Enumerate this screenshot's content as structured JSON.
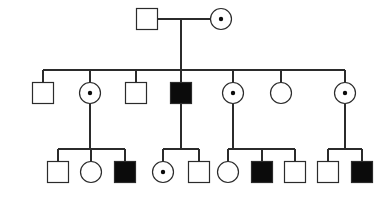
{
  "figure": {
    "kind": "pedigree-chart",
    "title": "Pedigree chart",
    "background_color": "#ffffff",
    "line_color": "#2b2b2b",
    "affected_fill": "#0b0b0b",
    "unaffected_fill": "#ffffff",
    "carrier_dot_color": "#0b0b0b"
  },
  "legend_semantics": {
    "square": "male",
    "circle": "female",
    "filled": "affected",
    "open": "unaffected",
    "dot_in_center": "carrier"
  },
  "chart_data": {
    "type": "diagram",
    "title": "Pedigree chart",
    "generations": [
      {
        "id": "I",
        "label": "I",
        "y": 19,
        "individuals": [
          {
            "id": "I-1",
            "sex": "male",
            "shape": "square",
            "status": "unaffected",
            "carrier": false,
            "cx": 147,
            "cy": 19
          },
          {
            "id": "I-2",
            "sex": "female",
            "shape": "circle",
            "status": "unaffected",
            "carrier": true,
            "cx": 221,
            "cy": 19
          }
        ]
      },
      {
        "id": "II",
        "label": "II",
        "y": 93,
        "individuals": [
          {
            "id": "II-1",
            "sex": "male",
            "shape": "square",
            "status": "unaffected",
            "carrier": false,
            "cx": 43,
            "cy": 93
          },
          {
            "id": "II-2",
            "sex": "female",
            "shape": "circle",
            "status": "unaffected",
            "carrier": true,
            "cx": 90,
            "cy": 93
          },
          {
            "id": "II-3",
            "sex": "male",
            "shape": "square",
            "status": "unaffected",
            "carrier": false,
            "cx": 136,
            "cy": 93
          },
          {
            "id": "II-4",
            "sex": "male",
            "shape": "square",
            "status": "affected",
            "carrier": false,
            "cx": 181,
            "cy": 93
          },
          {
            "id": "II-5",
            "sex": "female",
            "shape": "circle",
            "status": "unaffected",
            "carrier": true,
            "cx": 233,
            "cy": 93
          },
          {
            "id": "II-6",
            "sex": "female",
            "shape": "circle",
            "status": "unaffected",
            "carrier": false,
            "cx": 281,
            "cy": 93
          },
          {
            "id": "II-7",
            "sex": "female",
            "shape": "circle",
            "status": "unaffected",
            "carrier": true,
            "cx": 345,
            "cy": 93
          }
        ]
      },
      {
        "id": "III",
        "label": "III",
        "y": 172,
        "individuals": [
          {
            "id": "III-1",
            "sex": "male",
            "shape": "square",
            "status": "unaffected",
            "carrier": false,
            "cx": 58,
            "cy": 172
          },
          {
            "id": "III-2",
            "sex": "female",
            "shape": "circle",
            "status": "unaffected",
            "carrier": false,
            "cx": 91,
            "cy": 172
          },
          {
            "id": "III-3",
            "sex": "male",
            "shape": "square",
            "status": "affected",
            "carrier": false,
            "cx": 125,
            "cy": 172
          },
          {
            "id": "III-4",
            "sex": "female",
            "shape": "circle",
            "status": "unaffected",
            "carrier": true,
            "cx": 163,
            "cy": 172
          },
          {
            "id": "III-5",
            "sex": "male",
            "shape": "square",
            "status": "unaffected",
            "carrier": false,
            "cx": 199,
            "cy": 172
          },
          {
            "id": "III-6",
            "sex": "female",
            "shape": "circle",
            "status": "unaffected",
            "carrier": false,
            "cx": 228,
            "cy": 172
          },
          {
            "id": "III-7",
            "sex": "male",
            "shape": "square",
            "status": "affected",
            "carrier": false,
            "cx": 262,
            "cy": 172
          },
          {
            "id": "III-8",
            "sex": "male",
            "shape": "square",
            "status": "unaffected",
            "carrier": false,
            "cx": 295,
            "cy": 172
          },
          {
            "id": "III-9",
            "sex": "male",
            "shape": "square",
            "status": "unaffected",
            "carrier": false,
            "cx": 328,
            "cy": 172
          },
          {
            "id": "III-10",
            "sex": "male",
            "shape": "square",
            "status": "affected",
            "carrier": false,
            "cx": 362,
            "cy": 172
          }
        ]
      }
    ],
    "unions": [
      {
        "id": "union-I",
        "partners": [
          "I-1",
          "I-2"
        ],
        "y": 19,
        "x1": 158,
        "x2": 210,
        "descent_x": 181
      }
    ],
    "sibships": [
      {
        "id": "sibship-II",
        "parents": [
          "I-1",
          "I-2"
        ],
        "bar_y": 70,
        "bar_x1": 43,
        "bar_x2": 345,
        "descent_from_x": 181,
        "descent_from_y": 19,
        "child_stems": [
          43,
          90,
          136,
          181,
          233,
          281,
          345
        ],
        "children": [
          "II-1",
          "II-2",
          "II-3",
          "II-4",
          "II-5",
          "II-6",
          "II-7"
        ]
      },
      {
        "id": "sibship-III-a",
        "parents": [
          "II-2"
        ],
        "bar_y": 149,
        "bar_x1": 58,
        "bar_x2": 125,
        "descent_from_x": 90,
        "descent_from_y": 93,
        "child_stems": [
          58,
          91,
          125
        ],
        "children": [
          "III-1",
          "III-2",
          "III-3"
        ]
      },
      {
        "id": "sibship-III-b",
        "parents": [
          "II-4"
        ],
        "bar_y": 149,
        "bar_x1": 163,
        "bar_x2": 199,
        "descent_from_x": 181,
        "descent_from_y": 93,
        "child_stems": [
          163,
          199
        ],
        "children": [
          "III-4",
          "III-5"
        ]
      },
      {
        "id": "sibship-III-c",
        "parents": [
          "II-5"
        ],
        "bar_y": 149,
        "bar_x1": 228,
        "bar_x2": 295,
        "descent_from_x": 233,
        "descent_from_y": 93,
        "child_stems": [
          228,
          262,
          295
        ],
        "children": [
          "III-6",
          "III-7",
          "III-8"
        ]
      },
      {
        "id": "sibship-III-d",
        "parents": [
          "II-7"
        ],
        "bar_y": 149,
        "bar_x1": 328,
        "bar_x2": 362,
        "descent_from_x": 345,
        "descent_from_y": 93,
        "child_stems": [
          328,
          362
        ],
        "children": [
          "III-9",
          "III-10"
        ]
      }
    ],
    "geometry": {
      "square_size": 21,
      "circle_radius": 10.5,
      "carrier_dot_radius": 2.2,
      "stem_length": 14
    }
  }
}
